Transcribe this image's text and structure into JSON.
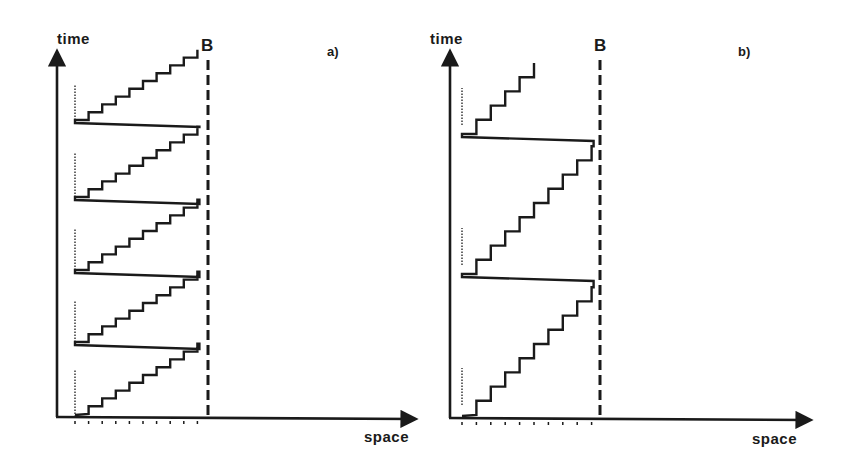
{
  "figure": {
    "panels": [
      {
        "id": "a",
        "panel_label": "a)",
        "y_axis_label": "time",
        "x_axis_label": "space",
        "boundary_label": "B"
      },
      {
        "id": "b",
        "panel_label": "b)",
        "y_axis_label": "time",
        "x_axis_label": "space",
        "boundary_label": "B"
      }
    ],
    "colors": {
      "ink": "#1a1a1a",
      "background": "#ffffff"
    }
  },
  "geometry": {
    "a": {
      "axis_origin": [
        57,
        417
      ],
      "y_axis_top": 52,
      "x_axis_end": 415,
      "start_x": 75,
      "boundary_x": 208,
      "boundary_top": 40,
      "step_w": 13.6,
      "step_h": 7.8,
      "steps_per_cycle": 9,
      "cycles": [
        {
          "y0": 417,
          "steps": 9,
          "return_y": 345
        },
        {
          "y0": 345,
          "steps": 9,
          "return_y": 273
        },
        {
          "y0": 273,
          "steps": 9,
          "return_y": 200
        },
        {
          "y0": 200,
          "steps": 9,
          "return_y": 123
        },
        {
          "y0": 123,
          "steps": 9,
          "return_y": null
        }
      ],
      "dotted_lines": [
        [
          417,
          370
        ],
        [
          345,
          300
        ],
        [
          273,
          228
        ],
        [
          200,
          152
        ],
        [
          123,
          84
        ]
      ],
      "ticks": 10
    },
    "b": {
      "axis_origin": [
        450,
        418
      ],
      "y_axis_top": 52,
      "x_axis_end": 810,
      "start_x": 462,
      "boundary_x": 600,
      "boundary_top": 40,
      "step_w": 14.4,
      "step_h": 14.2,
      "steps_per_cycle": 9,
      "cycles": [
        {
          "y0": 418,
          "steps": 9,
          "return_y": 277
        },
        {
          "y0": 277,
          "steps": 9,
          "return_y": 137
        },
        {
          "y0": 137,
          "steps": 5,
          "return_y": null
        }
      ],
      "dotted_lines": [
        [
          405,
          368
        ],
        [
          265,
          228
        ],
        [
          125,
          88
        ]
      ],
      "ticks": 10
    }
  }
}
